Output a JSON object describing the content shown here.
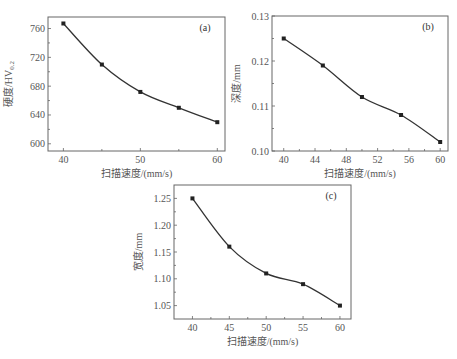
{
  "chart_data": [
    {
      "id": "a",
      "type": "line",
      "panel_label": "(a)",
      "title": "",
      "xlabel": "扫描速度/(mm/s)",
      "ylabel": "硬度/HV0.2",
      "x": [
        40,
        45,
        50,
        55,
        60
      ],
      "series": [
        {
          "name": "硬度",
          "values": [
            767,
            710,
            672,
            650,
            630
          ]
        }
      ],
      "xticks": [
        40,
        50,
        60
      ],
      "xlim": [
        38,
        61
      ],
      "yticks": [
        600,
        640,
        680,
        720,
        760
      ],
      "ylim": [
        590,
        776
      ],
      "grid": false,
      "legend": null
    },
    {
      "id": "b",
      "type": "line",
      "panel_label": "(b)",
      "title": "",
      "xlabel": "扫描速度/(mm/s)",
      "ylabel": "深度/mm",
      "x": [
        40,
        45,
        50,
        55,
        60
      ],
      "series": [
        {
          "name": "深度",
          "values": [
            0.125,
            0.119,
            0.112,
            0.108,
            0.102
          ]
        }
      ],
      "xticks": [
        40,
        44,
        48,
        52,
        56,
        60
      ],
      "xlim": [
        38.5,
        61
      ],
      "yticks": [
        0.1,
        0.11,
        0.12,
        0.13
      ],
      "yticks_labels": [
        "0.10",
        "0.11",
        "0.12",
        "0.13"
      ],
      "ylim": [
        0.1,
        0.13
      ],
      "grid": false,
      "legend": null
    },
    {
      "id": "c",
      "type": "line",
      "panel_label": "(c)",
      "title": "",
      "xlabel": "扫描速度/(mm/s)",
      "ylabel": "宽度/mm",
      "x": [
        40,
        45,
        50,
        55,
        60
      ],
      "series": [
        {
          "name": "宽度",
          "values": [
            1.25,
            1.16,
            1.11,
            1.09,
            1.05
          ]
        }
      ],
      "xticks": [
        40,
        45,
        50,
        55,
        60
      ],
      "xlim": [
        37.5,
        61.5
      ],
      "yticks": [
        1.05,
        1.1,
        1.15,
        1.2,
        1.25
      ],
      "yticks_labels": [
        "1.05",
        "1.10",
        "1.15",
        "1.20",
        "1.25"
      ],
      "ylim": [
        1.025,
        1.275
      ],
      "grid": false,
      "legend": null
    }
  ]
}
